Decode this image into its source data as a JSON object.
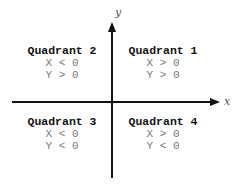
{
  "axes": {
    "x_label": "x",
    "y_label": "y",
    "color": "#111111"
  },
  "quadrants": [
    {
      "id": 1,
      "title": "Quadrant 1",
      "x_condition": "X > 0",
      "y_condition": "Y > 0"
    },
    {
      "id": 2,
      "title": "Quadrant 2",
      "x_condition": "X < 0",
      "y_condition": "Y > 0"
    },
    {
      "id": 3,
      "title": "Quadrant 3",
      "x_condition": "X < 0",
      "y_condition": "Y < 0"
    },
    {
      "id": 4,
      "title": "Quadrant 4",
      "x_condition": "X > 0",
      "y_condition": "Y < 0"
    }
  ]
}
